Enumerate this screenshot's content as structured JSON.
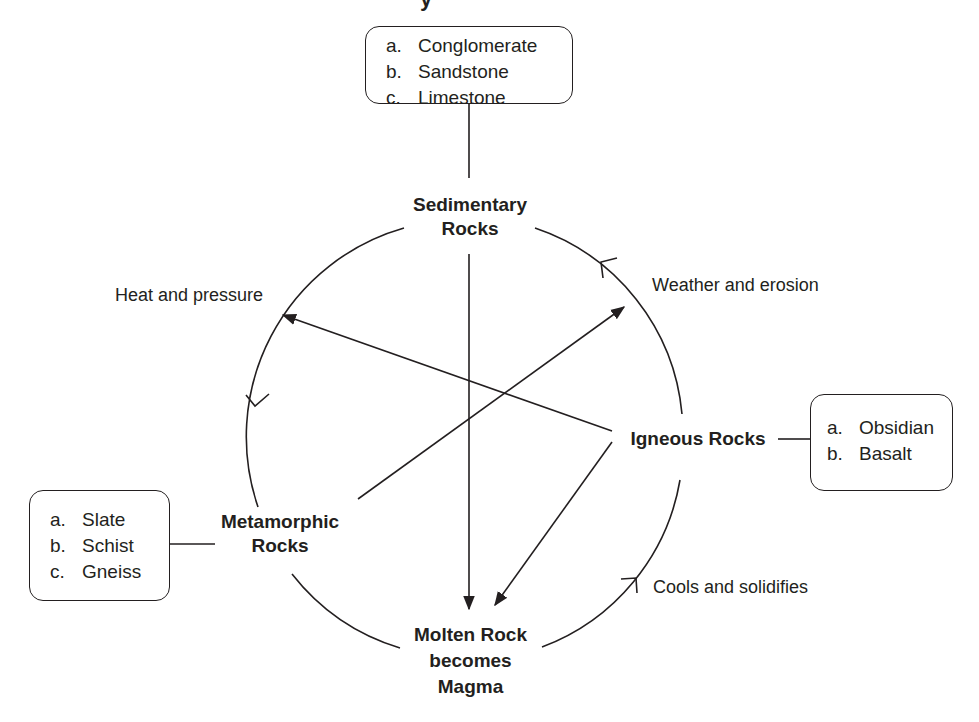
{
  "title_fragment": "y",
  "nodes": {
    "sedimentary": [
      "Sedimentary",
      "Rocks"
    ],
    "igneous": [
      "Igneous Rocks"
    ],
    "metamorphic": [
      "Metamorphic",
      "Rocks"
    ],
    "magma": [
      "Molten Rock",
      "becomes",
      "Magma"
    ]
  },
  "process_labels": {
    "heat_pressure": "Heat and pressure",
    "weather_erosion": "Weather and erosion",
    "cools_solidifies": "Cools and solidifies"
  },
  "example_boxes": {
    "sedimentary": [
      {
        "letter": "a.",
        "text": "Conglomerate"
      },
      {
        "letter": "b.",
        "text": "Sandstone"
      },
      {
        "letter": "c.",
        "text": "Limestone"
      }
    ],
    "igneous": [
      {
        "letter": "a.",
        "text": "Obsidian"
      },
      {
        "letter": "b.",
        "text": "Basalt"
      }
    ],
    "metamorphic": [
      {
        "letter": "a.",
        "text": "Slate"
      },
      {
        "letter": "b.",
        "text": "Schist"
      },
      {
        "letter": "c.",
        "text": "Gneiss"
      }
    ]
  },
  "colors": {
    "stroke": "#231f20",
    "background": "#ffffff"
  }
}
